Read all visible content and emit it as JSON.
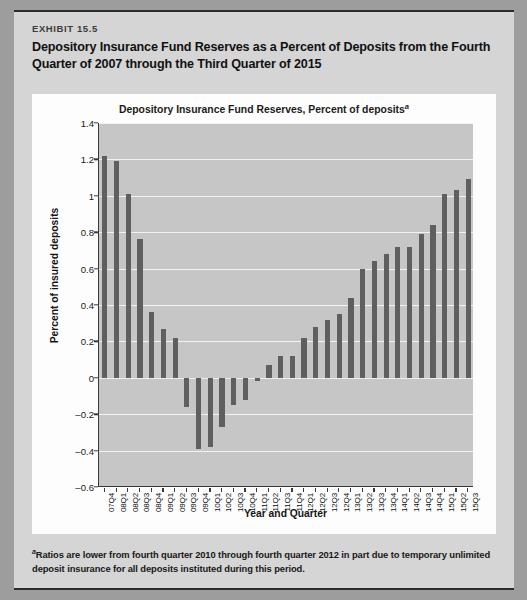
{
  "exhibit": {
    "number": "EXHIBIT 15.5",
    "title": "Depository Insurance Fund Reserves as a Percent of Deposits from the Fourth Quarter of 2007 through the Third Quarter of 2015",
    "footnote_marker": "a",
    "footnote": "Ratios are lower from fourth quarter 2010 through fourth quarter 2012 in part due to temporary unlimited deposit insurance for all deposits instituted during this period."
  },
  "colors": {
    "card_background": "#d5d5d5",
    "panel_background": "#fdfdfd",
    "plot_background": "#c6c6c6",
    "bar_fill": "#5f5f5f",
    "gridline": "#f2f2f2",
    "axis_line": "#3a3a3a",
    "page_background": "#9d9d9d"
  },
  "chart_data": {
    "type": "bar",
    "title": "Depository Insurance Fund Reserves, Percent of deposits",
    "title_superscript": "a",
    "xlabel": "Year and Quarter",
    "ylabel": "Percent of insured deposits",
    "ylim": [
      -0.6,
      1.4
    ],
    "yticks": [
      1.4,
      1.2,
      1,
      0.8,
      0.6,
      0.4,
      0.2,
      0,
      -0.2,
      -0.4,
      -0.6
    ],
    "ytick_labels": [
      "1.4",
      "1.2",
      "1",
      "0.8",
      "0.6",
      "0.4",
      "0.2",
      "0",
      "–0.2",
      "–0.4",
      "–0.6"
    ],
    "grid": true,
    "legend": false,
    "categories": [
      "07Q4",
      "08Q1",
      "08Q2",
      "08Q3",
      "08Q4",
      "09Q1",
      "09Q2",
      "09Q3",
      "09Q4",
      "10Q1",
      "10Q2",
      "10Q3",
      "10Q4",
      "11Q1",
      "11Q2",
      "11Q3",
      "11Q4",
      "12Q1",
      "12Q2",
      "12Q3",
      "12Q4",
      "13Q1",
      "13Q2",
      "13Q3",
      "13Q4",
      "14Q1",
      "14Q2",
      "14Q3",
      "14Q4",
      "15Q1",
      "15Q2",
      "15Q3"
    ],
    "values": [
      1.22,
      1.19,
      1.01,
      0.76,
      0.36,
      0.27,
      0.22,
      -0.16,
      -0.39,
      -0.38,
      -0.27,
      -0.15,
      -0.12,
      -0.02,
      0.07,
      0.12,
      0.12,
      0.22,
      0.28,
      0.32,
      0.35,
      0.44,
      0.6,
      0.64,
      0.68,
      0.72,
      0.72,
      0.79,
      0.84,
      1.01,
      1.03,
      1.09
    ]
  }
}
